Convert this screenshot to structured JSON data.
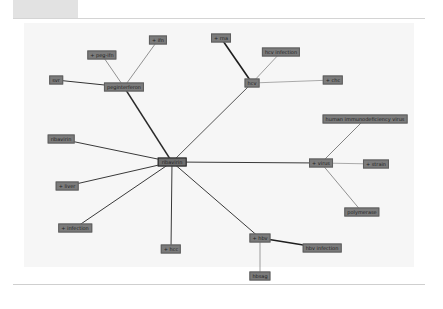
{
  "graph": {
    "center": {
      "id": "ribavirin",
      "label": "ribavirin",
      "x": 172,
      "y": 162
    },
    "nodes": [
      {
        "id": "peginterferon",
        "label": "peginterferon",
        "x": 124,
        "y": 87
      },
      {
        "id": "peg-ifn",
        "label": "+ peg-ifn",
        "x": 102,
        "y": 55
      },
      {
        "id": "ifn",
        "label": "+ ifn",
        "x": 158,
        "y": 40
      },
      {
        "id": "svr",
        "label": "svr",
        "x": 56,
        "y": 80
      },
      {
        "id": "hcv",
        "label": "hcv",
        "x": 252,
        "y": 83
      },
      {
        "id": "rna",
        "label": "+ rna",
        "x": 221,
        "y": 38
      },
      {
        "id": "hcv-infection-top",
        "label": "hcv infection",
        "x": 281,
        "y": 52
      },
      {
        "id": "chc",
        "label": "+ chc",
        "x": 333,
        "y": 80
      },
      {
        "id": "ribavirin-node",
        "label": "ribavirin",
        "x": 61,
        "y": 139
      },
      {
        "id": "liver",
        "label": "+ liver",
        "x": 67,
        "y": 186
      },
      {
        "id": "infection",
        "label": "+ infection",
        "x": 75,
        "y": 228
      },
      {
        "id": "hcc",
        "label": "+ hcc",
        "x": 171,
        "y": 249
      },
      {
        "id": "virus",
        "label": "+ virus",
        "x": 321,
        "y": 163
      },
      {
        "id": "hiv-virus",
        "label": "human immunodeficiency virus",
        "x": 365,
        "y": 119
      },
      {
        "id": "strain",
        "label": "+ strain",
        "x": 376,
        "y": 164
      },
      {
        "id": "polymerase",
        "label": "polymerase",
        "x": 362,
        "y": 212
      },
      {
        "id": "hbv",
        "label": "+ hbv",
        "x": 260,
        "y": 238
      },
      {
        "id": "hbv-infection",
        "label": "hbv infection",
        "x": 322,
        "y": 248
      },
      {
        "id": "hbsag",
        "label": "hbsag",
        "x": 260,
        "y": 276
      }
    ],
    "edges": [
      {
        "from": "ribavirin",
        "to": "peginterferon",
        "width": 1.4,
        "color": "#2a2a2a"
      },
      {
        "from": "ribavirin",
        "to": "hcv",
        "width": 0.9,
        "color": "#444444"
      },
      {
        "from": "ribavirin",
        "to": "ribavirin-node",
        "width": 1.0,
        "color": "#3a3a3a"
      },
      {
        "from": "ribavirin",
        "to": "liver",
        "width": 1.0,
        "color": "#3a3a3a"
      },
      {
        "from": "ribavirin",
        "to": "infection",
        "width": 1.0,
        "color": "#3a3a3a"
      },
      {
        "from": "ribavirin",
        "to": "hcc",
        "width": 1.0,
        "color": "#3a3a3a"
      },
      {
        "from": "ribavirin",
        "to": "virus",
        "width": 1.0,
        "color": "#3a3a3a"
      },
      {
        "from": "ribavirin",
        "to": "hbv",
        "width": 1.0,
        "color": "#3a3a3a"
      },
      {
        "from": "peginterferon",
        "to": "peg-ifn",
        "width": 0.7,
        "color": "#666666"
      },
      {
        "from": "peginterferon",
        "to": "ifn",
        "width": 0.7,
        "color": "#666666"
      },
      {
        "from": "peginterferon",
        "to": "svr",
        "width": 1.0,
        "color": "#333333"
      },
      {
        "from": "hcv",
        "to": "rna",
        "width": 1.6,
        "color": "#1e1e1e"
      },
      {
        "from": "hcv",
        "to": "hcv-infection-top",
        "width": 0.7,
        "color": "#777777"
      },
      {
        "from": "hcv",
        "to": "chc",
        "width": 0.7,
        "color": "#888888"
      },
      {
        "from": "virus",
        "to": "hiv-virus",
        "width": 0.8,
        "color": "#666666"
      },
      {
        "from": "virus",
        "to": "strain",
        "width": 0.7,
        "color": "#888888"
      },
      {
        "from": "virus",
        "to": "polymerase",
        "width": 0.8,
        "color": "#777777"
      },
      {
        "from": "hbv",
        "to": "hbv-infection",
        "width": 1.4,
        "color": "#1e1e1e"
      },
      {
        "from": "hbv",
        "to": "hbsag",
        "width": 0.7,
        "color": "#777777"
      }
    ]
  }
}
